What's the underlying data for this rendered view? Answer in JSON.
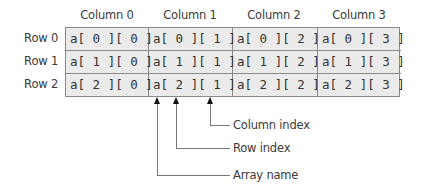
{
  "column_headers": [
    "Column 0",
    "Column 1",
    "Column 2",
    "Column 3"
  ],
  "row_headers": [
    "Row 0",
    "Row 1",
    "Row 2"
  ],
  "cells": [
    [
      "a[ 0 ][ 0 ]",
      "a[ 0 ][ 1 ]",
      "a[ 0 ][ 2 ]",
      "a[ 0 ][ 3 ]"
    ],
    [
      "a[ 1 ][ 0 ]",
      "a[ 1 ][ 1 ]",
      "a[ 1 ][ 2 ]",
      "a[ 1 ][ 3 ]"
    ],
    [
      "a[ 2 ][ 0 ]",
      "a[ 2 ][ 1 ]",
      "a[ 2 ][ 2 ]",
      "a[ 2 ][ 3 ]"
    ]
  ],
  "callouts": {
    "column_index": "Column index",
    "row_index": "Row index",
    "array_name": "Array name"
  },
  "colors": {
    "cell_background": "#ebebeb",
    "grid_border": "#8a8a8a",
    "arrow": "#111111",
    "leader_line": "#777777"
  }
}
